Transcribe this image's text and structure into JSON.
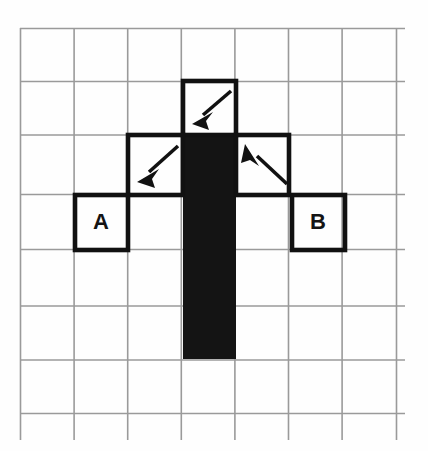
{
  "figure": {
    "title": "",
    "background_color": "#fefefe",
    "grid": {
      "line_color": "#9a9a9a",
      "origin_x": 20,
      "origin_y": 28,
      "cell_size": 53.6,
      "columns": 7,
      "rows": 7,
      "overhang_right": 8,
      "overhang_bottom": 12
    },
    "bold_color": "#111111",
    "fill_color": "#141414",
    "shapes": {
      "black_bar": {
        "name": "filled-vertical-bar",
        "col": 3,
        "row_start": 2,
        "row_end": 6,
        "x": 183,
        "y": 135,
        "width": 53,
        "height": 224,
        "color": "#141414"
      },
      "outlined_cells": [
        {
          "id": "top-cell",
          "col": 3,
          "row": 1,
          "x": 183,
          "y": 81,
          "size": 53,
          "label": ""
        },
        {
          "id": "mid-left-cell",
          "col": 2,
          "row": 2,
          "x": 129,
          "y": 135,
          "size": 53,
          "label": ""
        },
        {
          "id": "mid-right-cell",
          "col": 4,
          "row": 2,
          "x": 236,
          "y": 135,
          "size": 53,
          "label": ""
        },
        {
          "id": "cell-a",
          "col": 1,
          "row": 3,
          "x": 75,
          "y": 195,
          "size": 53,
          "label": "A"
        },
        {
          "id": "cell-b",
          "col": 5,
          "row": 3,
          "x": 293,
          "y": 195,
          "size": 53,
          "label": "B"
        }
      ]
    },
    "labels": {
      "a": "A",
      "b": "B"
    },
    "arrows": [
      {
        "id": "arrow-top",
        "direction": "down-left",
        "from_x": 231,
        "from_y": 91,
        "to_x": 194,
        "to_y": 123
      },
      {
        "id": "arrow-mid-left",
        "direction": "down-left",
        "from_x": 178,
        "from_y": 146,
        "to_x": 139,
        "to_y": 181
      },
      {
        "id": "arrow-mid-right",
        "direction": "up-left",
        "from_x": 286,
        "from_y": 183,
        "to_x": 246,
        "to_y": 145
      }
    ]
  }
}
